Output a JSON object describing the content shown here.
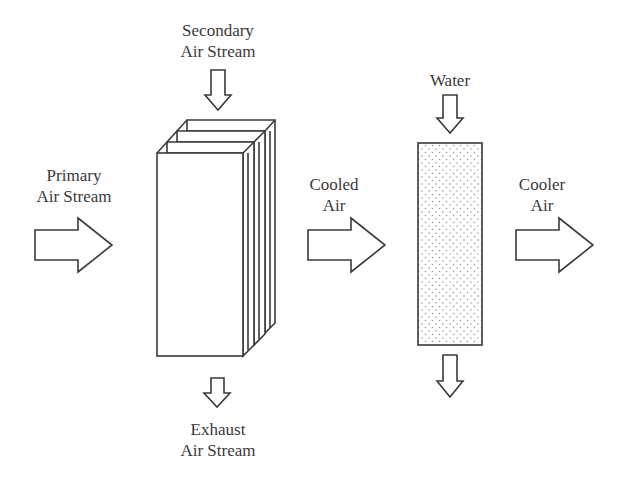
{
  "diagram": {
    "type": "indirect-direct evaporative cooling schematic",
    "colors": {
      "stroke": "#3a3a3a",
      "text": "#3a3a3a",
      "background": "#ffffff",
      "pad_dots": "#9a9a9a"
    },
    "labels": {
      "secondary": {
        "line1": "Secondary",
        "line2": "Air Stream"
      },
      "primary": {
        "line1": "Primary",
        "line2": "Air Stream"
      },
      "exhaust": {
        "line1": "Exhaust",
        "line2": "Air Stream"
      },
      "cooled": {
        "line1": "Cooled",
        "line2": "Air"
      },
      "water": {
        "line1": "Water"
      },
      "cooler": {
        "line1": "Cooler",
        "line2": "Air"
      }
    },
    "components": [
      {
        "id": "heat-exchanger",
        "description": "Indirect plate heat exchanger (stacked panels)"
      },
      {
        "id": "evaporative-pad",
        "description": "Direct evaporative media pad (dotted)"
      }
    ],
    "arrows": [
      {
        "id": "primary-air-in",
        "direction": "right"
      },
      {
        "id": "secondary-air-in",
        "direction": "down"
      },
      {
        "id": "exhaust-air-out",
        "direction": "down"
      },
      {
        "id": "cooled-air",
        "direction": "right"
      },
      {
        "id": "water-in",
        "direction": "down"
      },
      {
        "id": "water-out",
        "direction": "down"
      },
      {
        "id": "cooler-air-out",
        "direction": "right"
      }
    ]
  }
}
